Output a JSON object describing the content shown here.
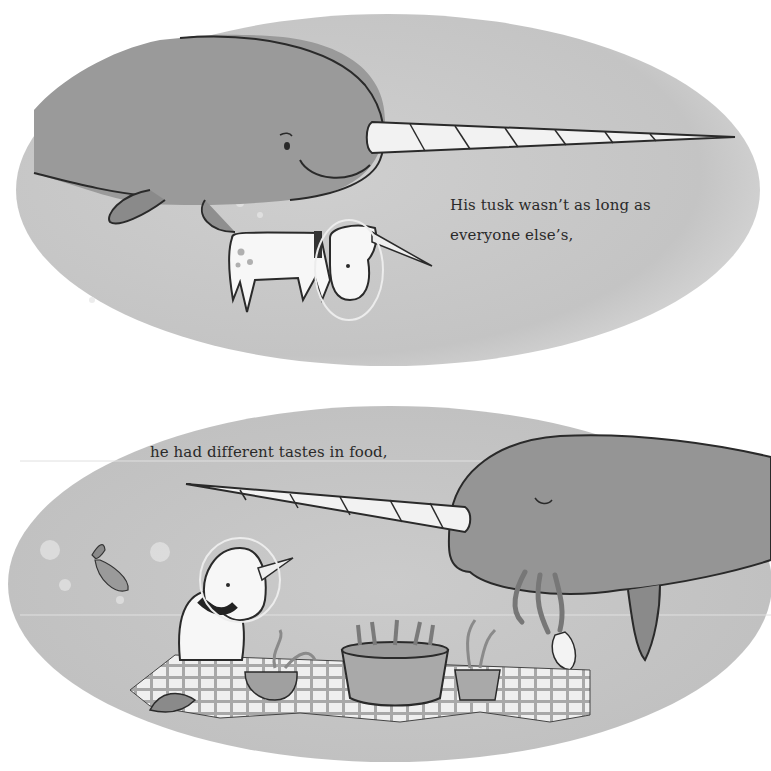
{
  "page": {
    "type": "picture-book-spread",
    "palette": {
      "background": "#ffffff",
      "water": "#c9c9c9",
      "water_dark": "#b3b3b3",
      "narwhal": "#9a9a9a",
      "narwhal_dark": "#868686",
      "outline": "#2a2a2a",
      "unicorn": "#f7f7f7",
      "tusk": "#f2f2f2",
      "text": "#2a2a2a"
    }
  },
  "panels": [
    {
      "id": "top",
      "caption_lines": [
        "His tusk wasn’t as long as",
        "everyone else’s,"
      ],
      "characters": [
        "narwhal",
        "unicorn-in-helmet"
      ]
    },
    {
      "id": "bottom",
      "caption_lines": [
        "he had different tastes in food,"
      ],
      "characters": [
        "narwhal",
        "unicorn-in-helmet",
        "fish"
      ],
      "objects": [
        "picnic-blanket",
        "bowl-of-seaweed",
        "bucket-of-shrimp",
        "cup-of-squid"
      ]
    }
  ]
}
